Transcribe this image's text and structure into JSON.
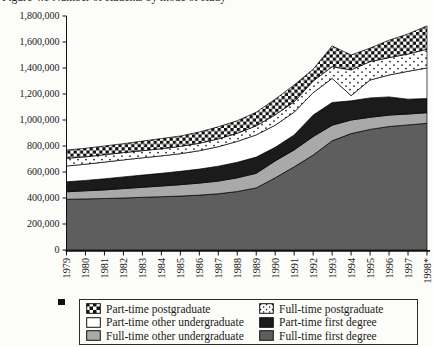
{
  "page": {
    "background": "#fcfcf9"
  },
  "title": {
    "text": "Figure 4.1   Number of students by mode of study",
    "clipped": "only bottom edge of text visible at top of image"
  },
  "chart_data": {
    "type": "area",
    "stacked": true,
    "title": "Figure 4.1   Number of students by mode of study",
    "xlabel": "",
    "ylabel": "",
    "grid": false,
    "x_labels": [
      "1979",
      "1980",
      "1981",
      "1982",
      "1983",
      "1984",
      "1985",
      "1986",
      "1987",
      "1988",
      "1989",
      "1990",
      "1991",
      "1992",
      "1993",
      "1994",
      "1995",
      "1996",
      "1997",
      "1998*"
    ],
    "y_axis": {
      "min": 0,
      "max": 1800000,
      "tick_step": 200000,
      "tick_labels": [
        "0",
        "200,000",
        "400,000",
        "600,000",
        "800,000",
        "1,000,000",
        "1,200,000",
        "1,400,000",
        "1,600,000",
        "1,800,000"
      ]
    },
    "series": [
      {
        "name": "Full-time first degree",
        "pattern": "darkgray",
        "values": [
          390000,
          393000,
          396000,
          400000,
          405000,
          410000,
          415000,
          422000,
          432000,
          450000,
          478000,
          555000,
          640000,
          730000,
          840000,
          895000,
          928000,
          950000,
          962000,
          975000
        ]
      },
      {
        "name": "Full-time other undergraduate",
        "pattern": "lightgray",
        "values": [
          58000,
          62000,
          66000,
          72000,
          77000,
          82000,
          87000,
          93000,
          98000,
          105000,
          112000,
          130000,
          130000,
          142000,
          120000,
          105000,
          93000,
          88000,
          84000,
          81000
        ]
      },
      {
        "name": "Part-time first degree",
        "pattern": "black",
        "values": [
          77000,
          80000,
          86000,
          90000,
          94000,
          98000,
          103000,
          107000,
          115000,
          120000,
          125000,
          105000,
          115000,
          166000,
          175000,
          148000,
          149000,
          140000,
          114000,
          109000
        ]
      },
      {
        "name": "Part-time other undergraduate",
        "pattern": "white",
        "values": [
          121000,
          125000,
          128000,
          131000,
          133000,
          134000,
          136000,
          142000,
          150000,
          160000,
          170000,
          170000,
          175000,
          172000,
          185000,
          40000,
          138000,
          168000,
          215000,
          235000
        ]
      },
      {
        "name": "Full-time postgraduate",
        "pattern": "dots",
        "values": [
          59000,
          57000,
          57000,
          56000,
          55000,
          55000,
          56000,
          57000,
          60000,
          63000,
          70000,
          80000,
          80000,
          90000,
          90000,
          197000,
          141000,
          134000,
          133000,
          145000
        ]
      },
      {
        "name": "Part-time postgraduate",
        "pattern": "checker",
        "values": [
          64000,
          65000,
          67000,
          69000,
          74000,
          78000,
          80000,
          87000,
          93000,
          97000,
          105000,
          120000,
          130000,
          90000,
          160000,
          115000,
          104000,
          134000,
          154000,
          179000
        ]
      }
    ],
    "colors": {
      "darkgray": "#5e5e5e",
      "lightgray": "#a9a9a9",
      "black": "#1b1b1b",
      "white": "#ffffff",
      "axis": "#111111"
    },
    "legend_position": "bottom"
  },
  "legend": {
    "items": [
      {
        "label": "Part-time postgraduate",
        "pattern": "checker"
      },
      {
        "label": "Full-time postgraduate",
        "pattern": "dots"
      },
      {
        "label": "Part-time other undergraduate",
        "pattern": "white"
      },
      {
        "label": "Part-time first degree",
        "pattern": "black"
      },
      {
        "label": "Full-time other undergraduate",
        "pattern": "lightgray"
      },
      {
        "label": "Full-time first degree",
        "pattern": "darkgray"
      }
    ]
  }
}
